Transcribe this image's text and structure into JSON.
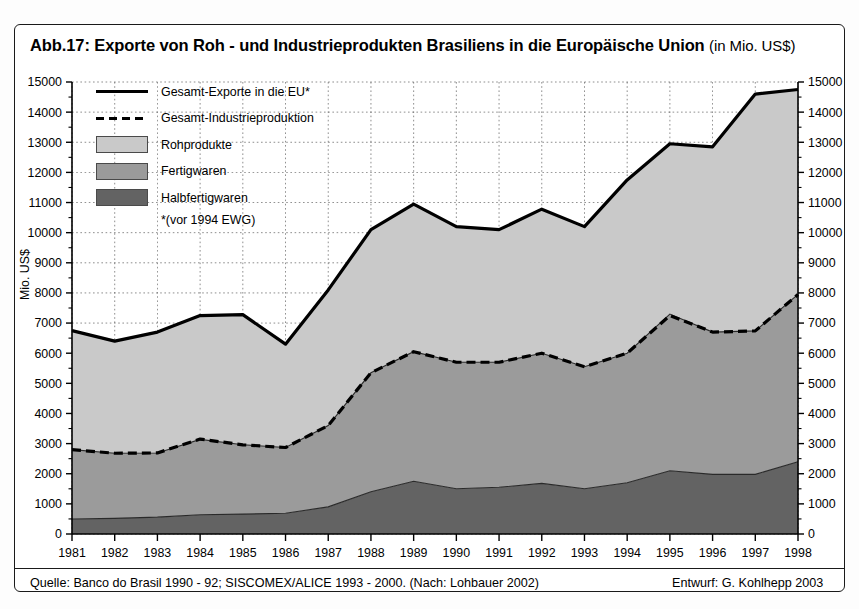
{
  "figure": {
    "title_main": "Abb.17: Exporte von Roh - und Industrieprodukten Brasiliens in die Europäische Union",
    "title_unit": "(in Mio. US$)",
    "source": "Quelle: Banco do Brasil 1990 - 92; SISCOMEX/ALICE 1993 - 2000. (Nach: Lohbauer 2002)",
    "credit": "Entwurf: G. Kohlhepp 2003",
    "footnote": "*(vor 1994 EWG)"
  },
  "legend": {
    "items": [
      {
        "label": "Gesamt-Exporte in die EU*",
        "key": "solid-line"
      },
      {
        "label": "Gesamt-Industrieproduktion",
        "key": "dashed-line"
      },
      {
        "label": "Rohprodukte",
        "key": "swatch-light",
        "color": "#c9c9c9"
      },
      {
        "label": "Fertigwaren",
        "key": "swatch-medium",
        "color": "#9b9b9b"
      },
      {
        "label": "Halbfertigwaren",
        "key": "swatch-dark",
        "color": "#636363"
      }
    ]
  },
  "axes": {
    "y_label": "Mio. US$",
    "y_ticks": [
      "0",
      "1000",
      "2000",
      "3000",
      "4000",
      "5000",
      "6000",
      "7000",
      "8000",
      "9000",
      "10000",
      "11000",
      "12000",
      "13000",
      "14000",
      "15000"
    ],
    "x_ticks": [
      "1981",
      "1982",
      "1983",
      "1984",
      "1985",
      "1986",
      "1987",
      "1988",
      "1989",
      "1990",
      "1991",
      "1992",
      "1993",
      "1994",
      "1995",
      "1996",
      "1997",
      "1998"
    ]
  },
  "chart_data": {
    "type": "area",
    "title": "Abb.17: Exporte von Roh - und Industrieprodukten Brasiliens in die Europäische Union (in Mio. US$)",
    "xlabel": "",
    "ylabel": "Mio. US$",
    "ylim": [
      0,
      15000
    ],
    "grid": true,
    "legend_position": "top-left",
    "stacked": true,
    "x": [
      1981,
      1982,
      1983,
      1984,
      1985,
      1986,
      1987,
      1988,
      1989,
      1990,
      1991,
      1992,
      1993,
      1994,
      1995,
      1996,
      1997,
      1998
    ],
    "series": [
      {
        "name": "Halbfertigwaren",
        "color": "#636363",
        "values": [
          500,
          520,
          560,
          640,
          660,
          690,
          900,
          1400,
          1750,
          1500,
          1550,
          1680,
          1500,
          1700,
          2100,
          1980,
          1980,
          2400
        ]
      },
      {
        "name": "Fertigwaren",
        "color": "#9b9b9b",
        "values": [
          2300,
          2160,
          2130,
          2500,
          2300,
          2180,
          2700,
          3950,
          4300,
          4200,
          4150,
          4320,
          4050,
          4300,
          5200,
          4720,
          4760,
          5550
        ]
      },
      {
        "name": "Rohprodukte",
        "color": "#c9c9c9",
        "values": [
          3950,
          3720,
          4010,
          4110,
          4320,
          3430,
          4500,
          4750,
          4900,
          4500,
          4400,
          4780,
          4650,
          5750,
          5650,
          6150,
          7850,
          6800
        ]
      }
    ],
    "lines": [
      {
        "name": "Gesamt-Exporte in die EU*",
        "style": "solid",
        "color": "#000000",
        "values": [
          6750,
          6400,
          6700,
          7250,
          7280,
          6300,
          8100,
          10100,
          10950,
          10200,
          10100,
          10780,
          10200,
          11750,
          12950,
          12850,
          14600,
          14750
        ]
      },
      {
        "name": "Gesamt-Industrieproduktion",
        "style": "dashed",
        "color": "#000000",
        "values": [
          2800,
          2680,
          2690,
          3150,
          2960,
          2870,
          3600,
          5350,
          6050,
          5700,
          5700,
          6000,
          5550,
          6000,
          7250,
          6700,
          6740,
          7950
        ]
      }
    ]
  }
}
